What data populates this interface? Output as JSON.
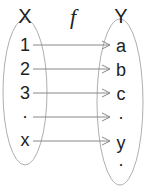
{
  "diagram": {
    "function_label": "f",
    "domain": {
      "label": "X",
      "elements": [
        "1",
        "2",
        "3",
        "·",
        "x"
      ]
    },
    "codomain": {
      "label": "Y",
      "elements": [
        "a",
        "b",
        "c",
        "·",
        "y",
        "·"
      ]
    },
    "mappings": [
      {
        "from": "1",
        "to": "a"
      },
      {
        "from": "2",
        "to": "b"
      },
      {
        "from": "3",
        "to": "c"
      },
      {
        "from": "·",
        "to": "·"
      },
      {
        "from": "x",
        "to": "y"
      }
    ],
    "colors": {
      "stroke": "#888888",
      "text": "#222222",
      "background": "#ffffff"
    }
  }
}
